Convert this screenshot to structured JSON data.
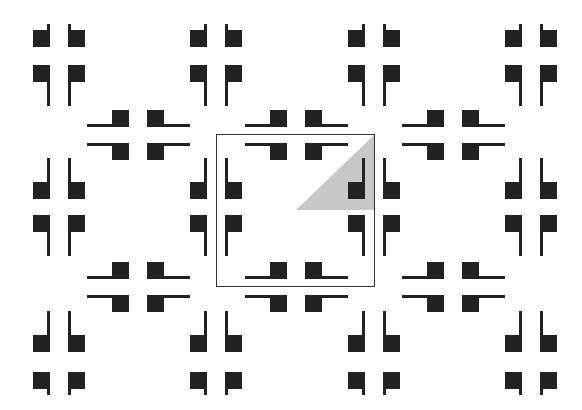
{
  "figure": {
    "colors": {
      "background": "#ffffff",
      "motif": "#222222",
      "frame": "#333333",
      "asymmetric_unit": "#c8c8c8"
    },
    "vertical_motif_columns_x": [
      33,
      190,
      348,
      505
    ],
    "vertical_motif_rows": [
      {
        "name": "top",
        "top_sq_y": 30,
        "bot_sq_y": 65,
        "top_stub": "short-up",
        "bot_stub": "long-down"
      },
      {
        "name": "middle",
        "top_sq_y": 182,
        "bot_sq_y": 215,
        "top_stub": "long-up",
        "bot_stub": "long-down"
      },
      {
        "name": "bottom",
        "top_sq_y": 335,
        "bot_sq_y": 372,
        "top_stub": "long-up",
        "bot_stub": "short-down"
      }
    ],
    "horizontal_motif_columns_x": [
      87,
      245,
      402
    ],
    "horizontal_motif_rows_y": [
      110,
      262
    ],
    "unit_cell": {
      "x": 216,
      "y": 134,
      "width": 159,
      "height": 153
    },
    "asymmetric_unit_triangle": [
      [
        296,
        210
      ],
      [
        374,
        135
      ],
      [
        374,
        210
      ]
    ]
  }
}
